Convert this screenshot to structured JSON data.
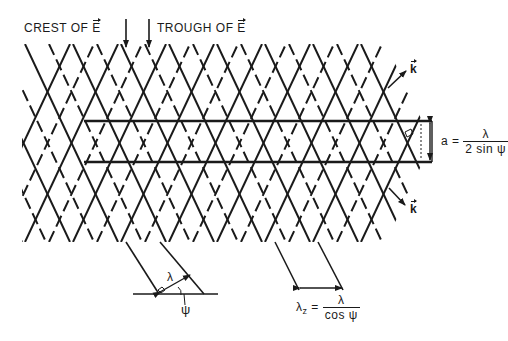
{
  "diagram": {
    "labels": {
      "crest": "CREST OF",
      "trough": "TROUGH  OF",
      "e_vector": "E",
      "k_vector_upper": "k",
      "k_vector_lower": "k",
      "a_symbol": "a =",
      "a_numerator": "λ",
      "a_denominator": "2 sin ψ",
      "lambda_label": "λ",
      "psi_label": "ψ",
      "lambda_z_symbol": "λ",
      "lambda_z_subscript": "z",
      "lambda_z_eq": "=",
      "lambda_z_numerator": "λ",
      "lambda_z_denominator": "cos ψ"
    },
    "colors": {
      "ink": "#1a1a1a",
      "background": "#ffffff"
    }
  }
}
